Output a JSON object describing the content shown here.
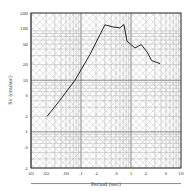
{
  "chart_data": {
    "type": "line",
    "title": "",
    "xlabel": "Period (sec)",
    "ylabel": "Sv (cm/sec)",
    "xscale": "log",
    "yscale": "log",
    "xlim": [
      0.01,
      10
    ],
    "ylim": [
      0.2,
      200
    ],
    "grid": true,
    "grid_style": "tripartite log grid with diagonal displacement and acceleration lines",
    "x_ticks": [
      ".01",
      ".02",
      ".05",
      ".1",
      ".2",
      ".5",
      "1",
      "2",
      "5",
      "10"
    ],
    "x_tick_values": [
      0.01,
      0.02,
      0.05,
      0.1,
      0.2,
      0.5,
      1,
      2,
      5,
      10
    ],
    "y_ticks": [
      "200",
      "100",
      "50",
      "20",
      "10",
      "5",
      "2",
      "1",
      ".5",
      ".2"
    ],
    "y_tick_values": [
      200,
      100,
      50,
      20,
      10,
      5,
      2,
      1,
      0.5,
      0.2
    ],
    "legend": [],
    "series": [
      {
        "name": "Response spectrum",
        "x": [
          0.021,
          0.038,
          0.076,
          0.15,
          0.24,
          0.3,
          0.42,
          0.6,
          0.72,
          0.83,
          1.2,
          1.6,
          2.1,
          2.6,
          3.8
        ],
        "y": [
          2.0,
          4.1,
          10,
          31,
          76,
          118,
          108,
          103,
          120,
          57,
          42,
          49,
          35,
          24,
          21
        ]
      }
    ]
  }
}
